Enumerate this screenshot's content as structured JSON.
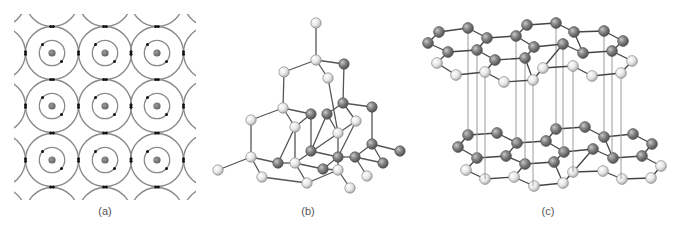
{
  "figure": {
    "panels": [
      {
        "id": "a",
        "label": "(a)",
        "label_x": 105,
        "description": "Atoms arranged in a square lattice, with shared electron pairs between adjacent atoms (covalent bonding)",
        "grid": {
          "cols_x": [
            52,
            105,
            157
          ],
          "rows_y": [
            53,
            106,
            160
          ],
          "outer_radius": 26.5,
          "inner_radius": 12.7,
          "nucleus_radius": 3.6
        },
        "colors": {
          "orbit": "#8a8a8a",
          "nucleus": "#7a7a7a",
          "electron": "#111111"
        }
      },
      {
        "id": "b",
        "label": "(b)",
        "label_x": 308,
        "description": "Diamond crystal structure (tetrahedral lattice)",
        "atoms": [
          {
            "x": 316,
            "y": 23,
            "t": "L"
          },
          {
            "x": 316,
            "y": 60,
            "t": "L"
          },
          {
            "x": 284,
            "y": 72,
            "t": "L"
          },
          {
            "x": 344,
            "y": 64,
            "t": "D"
          },
          {
            "x": 328,
            "y": 78,
            "t": "L"
          },
          {
            "x": 283,
            "y": 108,
            "t": "L"
          },
          {
            "x": 343,
            "y": 103,
            "t": "D"
          },
          {
            "x": 372,
            "y": 107,
            "t": "D"
          },
          {
            "x": 251,
            "y": 120,
            "t": "L"
          },
          {
            "x": 311,
            "y": 114,
            "t": "D"
          },
          {
            "x": 327,
            "y": 114,
            "t": "D"
          },
          {
            "x": 356,
            "y": 121,
            "t": "L"
          },
          {
            "x": 295,
            "y": 127,
            "t": "L"
          },
          {
            "x": 338,
            "y": 133,
            "t": "L"
          },
          {
            "x": 311,
            "y": 151,
            "t": "D"
          },
          {
            "x": 372,
            "y": 144,
            "t": "D"
          },
          {
            "x": 400,
            "y": 151,
            "t": "D"
          },
          {
            "x": 251,
            "y": 157,
            "t": "L"
          },
          {
            "x": 278,
            "y": 163,
            "t": "D"
          },
          {
            "x": 295,
            "y": 163,
            "t": "L"
          },
          {
            "x": 338,
            "y": 157,
            "t": "D"
          },
          {
            "x": 355,
            "y": 157,
            "t": "D"
          },
          {
            "x": 218,
            "y": 170,
            "t": "L"
          },
          {
            "x": 323,
            "y": 169,
            "t": "D"
          },
          {
            "x": 383,
            "y": 163,
            "t": "D"
          },
          {
            "x": 262,
            "y": 177,
            "t": "L"
          },
          {
            "x": 338,
            "y": 170,
            "t": "L"
          },
          {
            "x": 367,
            "y": 176,
            "t": "L"
          },
          {
            "x": 307,
            "y": 183,
            "t": "L"
          },
          {
            "x": 350,
            "y": 188,
            "t": "L"
          }
        ],
        "bonds": [
          [
            0,
            1
          ],
          [
            1,
            2
          ],
          [
            1,
            3
          ],
          [
            1,
            4
          ],
          [
            2,
            5
          ],
          [
            3,
            6
          ],
          [
            4,
            13
          ],
          [
            5,
            8
          ],
          [
            5,
            9
          ],
          [
            5,
            12
          ],
          [
            6,
            10
          ],
          [
            6,
            7
          ],
          [
            6,
            11
          ],
          [
            7,
            15
          ],
          [
            8,
            17
          ],
          [
            9,
            14
          ],
          [
            10,
            14
          ],
          [
            10,
            13
          ],
          [
            11,
            20
          ],
          [
            11,
            19
          ],
          [
            12,
            19
          ],
          [
            13,
            26
          ],
          [
            15,
            16
          ],
          [
            15,
            24
          ],
          [
            15,
            21
          ],
          [
            17,
            22
          ],
          [
            17,
            18
          ],
          [
            17,
            25
          ],
          [
            18,
            19
          ],
          [
            19,
            28
          ],
          [
            19,
            23
          ],
          [
            14,
            20
          ],
          [
            20,
            21
          ],
          [
            21,
            27
          ],
          [
            21,
            24
          ],
          [
            20,
            23
          ],
          [
            23,
            26
          ],
          [
            26,
            29
          ],
          [
            26,
            28
          ],
          [
            25,
            28
          ],
          [
            9,
            12
          ],
          [
            12,
            18
          ]
        ],
        "colors": {
          "dark_atom": "#7d7d7d",
          "light_atom": "#e4e4e4",
          "bond": "#555555"
        }
      },
      {
        "id": "c",
        "label": "(c)",
        "label_x": 548,
        "description": "Graphite structure: two stacked hexagonal carbon layers connected by vertical lines",
        "layer_offset": {
          "dx": 29,
          "dy": 105
        },
        "top_layer_atoms": [
          {
            "x": 439,
            "y": 32,
            "t": "D"
          },
          {
            "x": 468,
            "y": 28,
            "t": "D"
          },
          {
            "x": 428,
            "y": 43,
            "t": "D"
          },
          {
            "x": 487,
            "y": 38,
            "t": "D"
          },
          {
            "x": 516,
            "y": 36,
            "t": "D"
          },
          {
            "x": 527,
            "y": 25,
            "t": "D"
          },
          {
            "x": 556,
            "y": 23,
            "t": "D"
          },
          {
            "x": 574,
            "y": 32,
            "t": "D"
          },
          {
            "x": 604,
            "y": 31,
            "t": "D"
          },
          {
            "x": 623,
            "y": 41,
            "t": "D"
          },
          {
            "x": 448,
            "y": 52,
            "t": "D"
          },
          {
            "x": 477,
            "y": 50,
            "t": "D"
          },
          {
            "x": 534,
            "y": 47,
            "t": "D"
          },
          {
            "x": 563,
            "y": 44,
            "t": "D"
          },
          {
            "x": 583,
            "y": 53,
            "t": "D"
          },
          {
            "x": 612,
            "y": 51,
            "t": "D"
          },
          {
            "x": 437,
            "y": 63,
            "t": "L"
          },
          {
            "x": 495,
            "y": 60,
            "t": "D"
          },
          {
            "x": 525,
            "y": 58,
            "t": "D"
          },
          {
            "x": 632,
            "y": 61,
            "t": "L"
          },
          {
            "x": 456,
            "y": 75,
            "t": "L"
          },
          {
            "x": 485,
            "y": 72,
            "t": "L"
          },
          {
            "x": 543,
            "y": 68,
            "t": "L"
          },
          {
            "x": 573,
            "y": 66,
            "t": "L"
          },
          {
            "x": 504,
            "y": 82,
            "t": "L"
          },
          {
            "x": 533,
            "y": 80,
            "t": "L"
          },
          {
            "x": 592,
            "y": 76,
            "t": "L"
          },
          {
            "x": 621,
            "y": 73,
            "t": "L"
          }
        ],
        "bottom_layer_atoms": [
          {
            "x": 468,
            "y": 135,
            "t": "D"
          },
          {
            "x": 497,
            "y": 133,
            "t": "D"
          },
          {
            "x": 458,
            "y": 147,
            "t": "D"
          },
          {
            "x": 517,
            "y": 143,
            "t": "D"
          },
          {
            "x": 546,
            "y": 141,
            "t": "D"
          },
          {
            "x": 556,
            "y": 129,
            "t": "D"
          },
          {
            "x": 585,
            "y": 127,
            "t": "D"
          },
          {
            "x": 604,
            "y": 137,
            "t": "D"
          },
          {
            "x": 633,
            "y": 134,
            "t": "D"
          },
          {
            "x": 652,
            "y": 144,
            "t": "D"
          },
          {
            "x": 477,
            "y": 158,
            "t": "D"
          },
          {
            "x": 506,
            "y": 156,
            "t": "D"
          },
          {
            "x": 564,
            "y": 152,
            "t": "D"
          },
          {
            "x": 593,
            "y": 149,
            "t": "D"
          },
          {
            "x": 613,
            "y": 158,
            "t": "D"
          },
          {
            "x": 642,
            "y": 156,
            "t": "D"
          },
          {
            "x": 466,
            "y": 170,
            "t": "L"
          },
          {
            "x": 525,
            "y": 164,
            "t": "D"
          },
          {
            "x": 554,
            "y": 162,
            "t": "D"
          },
          {
            "x": 661,
            "y": 166,
            "t": "L"
          },
          {
            "x": 485,
            "y": 179,
            "t": "L"
          },
          {
            "x": 514,
            "y": 177,
            "t": "L"
          },
          {
            "x": 573,
            "y": 172,
            "t": "L"
          },
          {
            "x": 603,
            "y": 171,
            "t": "L"
          },
          {
            "x": 534,
            "y": 186,
            "t": "L"
          },
          {
            "x": 563,
            "y": 183,
            "t": "L"
          },
          {
            "x": 622,
            "y": 179,
            "t": "L"
          },
          {
            "x": 651,
            "y": 178,
            "t": "L"
          }
        ],
        "layer_bonds": [
          [
            0,
            1
          ],
          [
            0,
            2
          ],
          [
            1,
            3
          ],
          [
            2,
            10
          ],
          [
            3,
            4
          ],
          [
            3,
            11
          ],
          [
            4,
            5
          ],
          [
            4,
            12
          ],
          [
            5,
            6
          ],
          [
            6,
            7
          ],
          [
            7,
            8
          ],
          [
            7,
            14
          ],
          [
            8,
            9
          ],
          [
            9,
            15
          ],
          [
            10,
            11
          ],
          [
            10,
            16
          ],
          [
            11,
            17
          ],
          [
            12,
            13
          ],
          [
            12,
            18
          ],
          [
            13,
            14
          ],
          [
            13,
            22
          ],
          [
            14,
            15
          ],
          [
            15,
            19
          ],
          [
            16,
            20
          ],
          [
            17,
            18
          ],
          [
            17,
            21
          ],
          [
            18,
            25
          ],
          [
            19,
            27
          ],
          [
            20,
            21
          ],
          [
            21,
            24
          ],
          [
            22,
            23
          ],
          [
            22,
            25
          ],
          [
            23,
            26
          ],
          [
            24,
            25
          ],
          [
            26,
            27
          ]
        ],
        "verticals": [
          {
            "x": 468,
            "y1": 28,
            "y2": 135
          },
          {
            "x": 477,
            "y1": 50,
            "y2": 158
          },
          {
            "x": 485,
            "y1": 72,
            "y2": 179
          },
          {
            "x": 516,
            "y1": 36,
            "y2": 143
          },
          {
            "x": 525,
            "y1": 58,
            "y2": 164
          },
          {
            "x": 533,
            "y1": 80,
            "y2": 186
          },
          {
            "x": 556,
            "y1": 23,
            "y2": 129
          },
          {
            "x": 563,
            "y1": 44,
            "y2": 152
          },
          {
            "x": 573,
            "y1": 66,
            "y2": 172
          },
          {
            "x": 604,
            "y1": 31,
            "y2": 137
          },
          {
            "x": 612,
            "y1": 51,
            "y2": 158
          },
          {
            "x": 621,
            "y1": 73,
            "y2": 179
          }
        ],
        "colors": {
          "dark_atom": "#7d7d7d",
          "light_atom": "#e4e4e4",
          "bond": "#444444",
          "vertical": "#9a9a9a"
        }
      }
    ]
  }
}
